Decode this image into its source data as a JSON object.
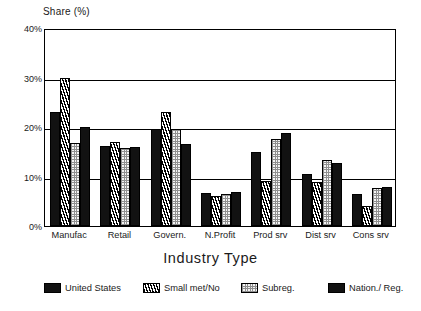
{
  "chart_data": {
    "type": "bar",
    "title": "",
    "ylabel": "Share (%)",
    "xlabel": "Industry Type",
    "ylim": [
      0,
      40
    ],
    "ytick_labels": [
      "0%",
      "10%",
      "20%",
      "30%",
      "40%"
    ],
    "ytick_values": [
      0,
      10,
      20,
      30,
      40
    ],
    "grid": true,
    "legend_position": "bottom",
    "categories": [
      "Manufac",
      "Retail",
      "Govern.",
      "N.Profit",
      "Prod srv",
      "Dist srv",
      "Cons srv"
    ],
    "series": [
      {
        "name": "United States",
        "fill": "solid",
        "values": [
          23.0,
          16.1,
          19.6,
          6.7,
          14.9,
          10.5,
          6.5
        ]
      },
      {
        "name": "Small met/No",
        "fill": "hatch",
        "values": [
          30.0,
          16.9,
          23.1,
          6.0,
          9.0,
          8.9,
          4.1
        ]
      },
      {
        "name": "Subreg.",
        "fill": "dots",
        "values": [
          16.7,
          15.8,
          19.7,
          6.4,
          17.6,
          13.4,
          7.7
        ]
      },
      {
        "name": "Nation./ Reg.",
        "fill": "solid",
        "values": [
          20.0,
          15.9,
          16.6,
          6.9,
          18.7,
          12.8,
          7.8
        ]
      }
    ],
    "colors": {
      "solid": "#121212",
      "hatch": "#e9e9e9",
      "dots": "#f4f4f4",
      "axis": "#000000",
      "text": "#1a1a1a"
    }
  },
  "legend": {
    "items": [
      {
        "label": "United States",
        "fill": "solid",
        "left": 0
      },
      {
        "label": "Small met/No",
        "fill": "hatch",
        "left": 99
      },
      {
        "label": "Subreg.",
        "fill": "dots",
        "left": 197
      },
      {
        "label": "Nation./ Reg.",
        "fill": "solid",
        "left": 284
      }
    ]
  }
}
